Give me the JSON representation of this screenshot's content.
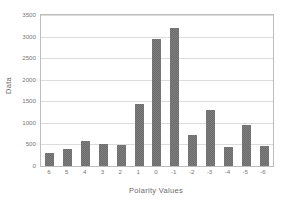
{
  "chart_data": {
    "type": "bar",
    "title": "",
    "xlabel": "Polarity Values",
    "ylabel": "Data",
    "categories": [
      "6",
      "5",
      "4",
      "3",
      "2",
      "1",
      "0",
      "-1",
      "-2",
      "-3",
      "-4",
      "-5",
      "-6"
    ],
    "values": [
      310,
      395,
      575,
      505,
      490,
      1440,
      2950,
      3200,
      730,
      1300,
      435,
      940,
      475
    ],
    "ylim": [
      0,
      3500
    ],
    "ytick_labels": [
      "3500",
      "3000",
      "2500",
      "2000",
      "1500",
      "1000",
      "500",
      "0"
    ],
    "ytick_values": [
      3500,
      3000,
      2500,
      2000,
      1500,
      1000,
      500,
      0
    ],
    "grid": true,
    "legend": null,
    "bar_color": "#7d7d7d",
    "bar_pattern": "checkered-dither",
    "grid_color": "#dcdcdc",
    "frame_color": "#bdbdbd",
    "text_color": "#787878"
  }
}
